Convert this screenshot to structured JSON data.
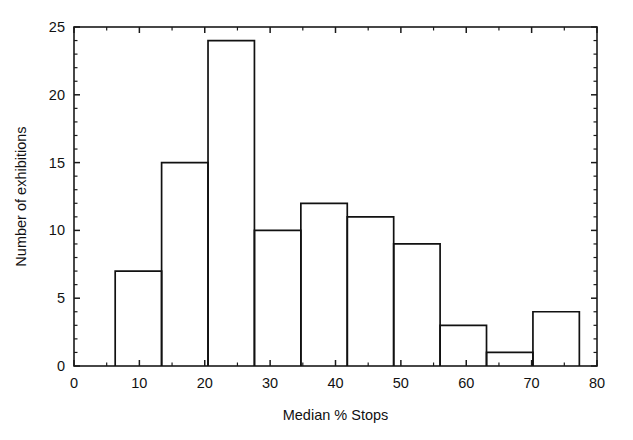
{
  "chart_data": {
    "type": "bar",
    "title": "",
    "subtitle": "",
    "xlabel": "Median % Stops",
    "ylabel": "Number of exhibitions",
    "xlim": [
      0,
      80
    ],
    "ylim": [
      0,
      25
    ],
    "x_ticks": [
      0,
      10,
      20,
      30,
      40,
      50,
      60,
      70,
      80
    ],
    "x_tick_labels": [
      "0",
      "10",
      "20",
      "30",
      "40",
      "50",
      "60",
      "70",
      "80"
    ],
    "x_minor_tick_step": 5,
    "y_ticks": [
      0,
      5,
      10,
      15,
      20,
      25
    ],
    "y_tick_labels": [
      "0",
      "5",
      "10",
      "15",
      "20",
      "25"
    ],
    "y_minor_tick_step": 1,
    "grid": false,
    "legend": false,
    "legend_position": "none",
    "bin_edges": [
      6.3,
      13.4,
      20.5,
      27.6,
      34.7,
      41.8,
      48.9,
      56.0,
      63.1,
      70.2,
      77.3
    ],
    "bin_width": 7.1,
    "categories": [
      "6.3-13.4",
      "13.4-20.5",
      "20.5-27.6",
      "27.6-34.7",
      "34.7-41.8",
      "41.8-48.9",
      "48.9-56.0",
      "56.0-63.1",
      "63.1-70.2",
      "70.2-77.3"
    ],
    "values": [
      7,
      15,
      24,
      10,
      12,
      11,
      9,
      3,
      1,
      4
    ],
    "bar_style": "outline",
    "bar_fill": "#ffffff",
    "bar_stroke": "#111111",
    "background": "#ffffff",
    "axis_color": "#1a1a1a"
  }
}
